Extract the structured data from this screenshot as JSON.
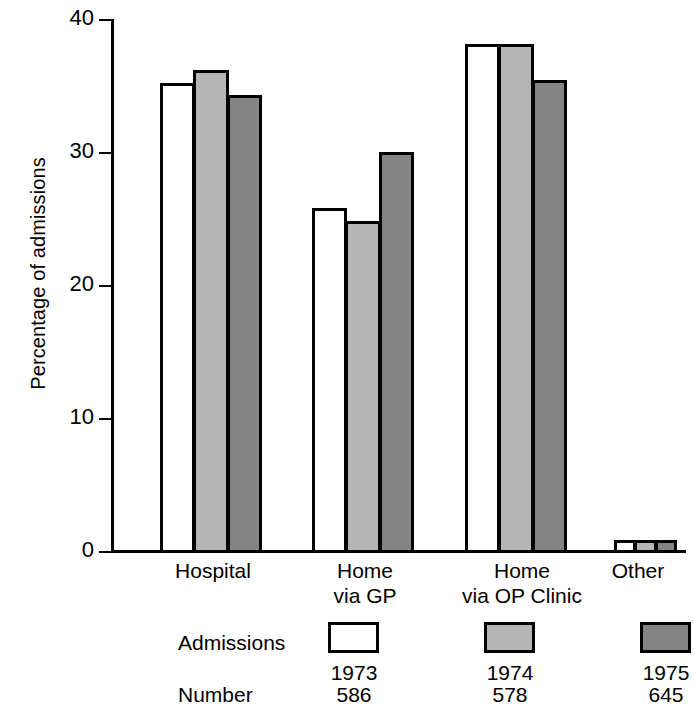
{
  "chart_data": {
    "type": "bar",
    "title": "",
    "xlabel": "",
    "ylabel": "Percentage of admissions",
    "ylim": [
      0,
      40
    ],
    "yticks": [
      0,
      10,
      20,
      30,
      40
    ],
    "ytick_labels": [
      "0",
      "10",
      "20",
      "30",
      "40"
    ],
    "grid": false,
    "legend_position": "below-axis",
    "categories": [
      "Hospital",
      "Home\nvia GP",
      "Home\nvia OP Clinic",
      "Other"
    ],
    "series": [
      {
        "name": "1973",
        "values": [
          35.2,
          25.8,
          38.1,
          0.8
        ],
        "color": "#ffffff"
      },
      {
        "name": "1974",
        "values": [
          36.2,
          24.8,
          38.1,
          0.8
        ],
        "color": "#b5b5b5"
      },
      {
        "name": "1975",
        "values": [
          34.3,
          30.0,
          35.4,
          0.8
        ],
        "color": "#848484"
      }
    ],
    "legend": {
      "row1_label": "Admissions",
      "row2_label": "Number",
      "years": [
        "1973",
        "1974",
        "1975"
      ],
      "numbers": [
        "586",
        "578",
        "645"
      ]
    }
  },
  "axis": {
    "y_title": "Percentage of admissions",
    "tick_40": "40",
    "tick_30": "30",
    "tick_20": "20",
    "tick_10": "10",
    "tick_0": "0"
  },
  "categories": {
    "c0": "Hospital",
    "c1": "Home\nvia GP",
    "c2": "Home\nvia OP Clinic",
    "c3": "Other"
  },
  "legend": {
    "admissions_label": "Admissions",
    "number_label": "Number",
    "year_1973": "1973",
    "year_1974": "1974",
    "year_1975": "1975",
    "number_1973": "586",
    "number_1974": "578",
    "number_1975": "645"
  }
}
